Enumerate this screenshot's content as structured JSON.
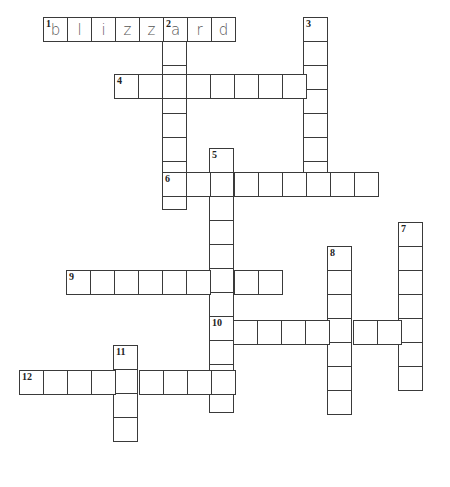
{
  "puzzle": {
    "type": "crossword",
    "cell_size": 24,
    "line_color": "#3a3a3a",
    "words": [
      {
        "number": 1,
        "direction": "across",
        "x": 43,
        "y": 17,
        "length": 8,
        "letters": [
          "b",
          "l",
          "i",
          "z",
          "z",
          "a",
          "r",
          "d"
        ]
      },
      {
        "number": 2,
        "direction": "down",
        "x": 162,
        "y": 17,
        "length": 8,
        "letters": [
          "a",
          "",
          "",
          "",
          "",
          "",
          "",
          ""
        ]
      },
      {
        "number": 3,
        "direction": "down",
        "x": 303,
        "y": 17,
        "length": 7,
        "letters": []
      },
      {
        "number": 4,
        "direction": "across",
        "x": 114,
        "y": 74,
        "length": 8,
        "letters": []
      },
      {
        "number": 5,
        "direction": "down",
        "x": 209,
        "y": 148,
        "length": 11,
        "letters": []
      },
      {
        "number": 6,
        "direction": "across",
        "x": 162,
        "y": 172,
        "length": 9,
        "letters": []
      },
      {
        "number": 7,
        "direction": "down",
        "x": 398,
        "y": 222,
        "length": 7,
        "letters": []
      },
      {
        "number": 8,
        "direction": "down",
        "x": 327,
        "y": 246,
        "length": 7,
        "letters": []
      },
      {
        "number": 9,
        "direction": "across",
        "x": 66,
        "y": 270,
        "length": 9,
        "letters": []
      },
      {
        "number": 10,
        "direction": "across",
        "x": 209,
        "y": 320,
        "length": 9,
        "letters": []
      },
      {
        "number": 11,
        "direction": "down",
        "x": 113,
        "y": 345,
        "length": 4,
        "letters": []
      },
      {
        "number": 12,
        "direction": "across",
        "x": 19,
        "y": 370,
        "length": 9,
        "letters": []
      }
    ]
  }
}
